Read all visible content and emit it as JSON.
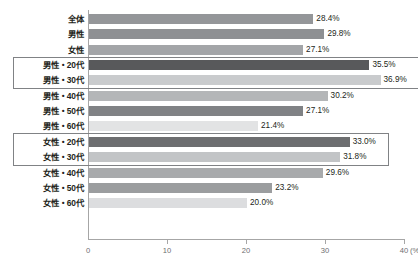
{
  "chart_data": {
    "type": "bar",
    "orientation": "horizontal",
    "title": "",
    "subtitle": "",
    "xlabel": "(%)",
    "ylabel": "",
    "xlim": [
      0,
      40
    ],
    "xticks": [
      0,
      10,
      20,
      30,
      40
    ],
    "xtick_labels": [
      "0",
      "10",
      "20",
      "30",
      "40"
    ],
    "unit_suffix": "(%)",
    "grid": false,
    "legend": "none",
    "categories": [
      "全体",
      "男性",
      "女性",
      "男性・20代",
      "男性・30代",
      "男性・40代",
      "男性・50代",
      "男性・60代",
      "女性・20代",
      "女性・30代",
      "女性・40代",
      "女性・50代",
      "女性・60代"
    ],
    "values": [
      28.4,
      29.8,
      27.1,
      35.5,
      36.9,
      30.2,
      27.1,
      21.4,
      33.0,
      31.8,
      29.6,
      23.2,
      20.0
    ],
    "value_labels": [
      "28.4%",
      "29.8%",
      "27.1%",
      "35.5%",
      "36.9%",
      "30.2%",
      "27.1%",
      "21.4%",
      "33.0%",
      "31.8%",
      "29.6%",
      "23.2%",
      "20.0%"
    ],
    "bar_colors": [
      "#949699",
      "#8e9093",
      "#a3a5a8",
      "#58595b",
      "#c9cbcd",
      "#b4b6b8",
      "#808285",
      "#e2e3e4",
      "#6d6e70",
      "#c2c4c6",
      "#a8aaac",
      "#9b9d9f",
      "#dcdddf"
    ],
    "highlight_groups": [
      {
        "name": "male-20s-30s",
        "first_index": 3,
        "last_index": 4
      },
      {
        "name": "female-20s-30s",
        "first_index": 8,
        "last_index": 9
      }
    ],
    "axis_color": "#a6a6a6",
    "label_color": "#231f20",
    "tick_label_color": "#6d6e70",
    "highlight_border_color": "#808285",
    "background": "#ffffff"
  },
  "caption": {
    "text": ""
  }
}
